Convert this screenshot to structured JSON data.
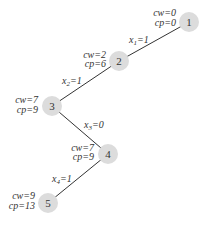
{
  "diagram": {
    "type": "tree-path",
    "colors": {
      "node_fill": "#dcdcdc",
      "edge": "#333333",
      "text": "#333333",
      "background": "#ffffff"
    },
    "nodes": [
      {
        "id": "1",
        "label": "1",
        "cw": "cw=0",
        "cp": "cp=0"
      },
      {
        "id": "2",
        "label": "2",
        "cw": "cw=2",
        "cp": "cp=6"
      },
      {
        "id": "3",
        "label": "3",
        "cw": "cw=7",
        "cp": "cp=9"
      },
      {
        "id": "4",
        "label": "4",
        "cw": "cw=7",
        "cp": "cp=9"
      },
      {
        "id": "5",
        "label": "5",
        "cw": "cw=9",
        "cp": "cp=13"
      }
    ],
    "edges": [
      {
        "from": "1",
        "to": "2",
        "var": "x",
        "sub": "1",
        "val": "=1"
      },
      {
        "from": "2",
        "to": "3",
        "var": "x",
        "sub": "2",
        "val": "=1"
      },
      {
        "from": "3",
        "to": "4",
        "var": "x",
        "sub": "3",
        "val": "=0"
      },
      {
        "from": "4",
        "to": "5",
        "var": "x",
        "sub": "4",
        "val": "=1"
      }
    ]
  }
}
